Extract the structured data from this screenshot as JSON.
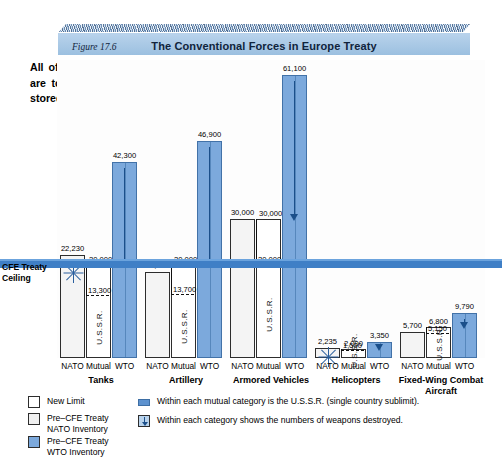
{
  "banner": {
    "figure_label": "Figure 17.6",
    "title": "The Conventional Forces in Europe Treaty"
  },
  "caption": "All of the weapons above the CFE Treaty Ceiling are to be destroyed, permanently redeployed, or stored outside of Europe.",
  "ceiling_label": "CFE Treaty Ceiling",
  "colors": {
    "wto_blue": "#7ca9dc",
    "ceiling_blue": "#3f7fc6",
    "banner_blue": "#b9d3ec",
    "arrow_blue": "#1b4f8a"
  },
  "series_labels": {
    "nato": "NATO",
    "mutual": "Mutual",
    "wto": "WTO",
    "ussr": "U.S.S.R."
  },
  "legend": {
    "swatches": [
      {
        "icon": "empty-square",
        "label": "New Limit"
      },
      {
        "icon": "stipple-square",
        "label": "Pre–CFE Treaty\nNATO Inventory"
      },
      {
        "icon": "blue-square",
        "label": "Pre–CFE Treaty\nWTO Inventory"
      }
    ],
    "notes": [
      {
        "icon": "sublimit-bar-icon",
        "label": "Within each mutual category is the U.S.S.R. (single country sublimit)."
      },
      {
        "icon": "down-arrow-box-icon",
        "label": "Within each category shows the numbers of weapons destroyed."
      }
    ]
  },
  "chart_data": {
    "type": "bar",
    "title": "The Conventional Forces in Europe Treaty",
    "xlabel": "",
    "ylabel": "",
    "ylim": [
      0,
      61100
    ],
    "grid": false,
    "legend_position": "bottom-left",
    "ceiling_note": "Horizontal blue band marks the CFE Treaty Ceiling for each category",
    "categories": [
      "Tanks",
      "Artillery",
      "Armored Vehicles",
      "Helicopters",
      "Fixed-Wing Combat Aircraft"
    ],
    "series": [
      {
        "name": "NATO",
        "values": [
          22230,
          18500,
          30000,
          2235,
          5700
        ]
      },
      {
        "name": "Mutual",
        "values": [
          20000,
          20000,
          30000,
          2000,
          6800
        ]
      },
      {
        "name": "WTO",
        "values": [
          42300,
          46900,
          61100,
          3350,
          9790
        ]
      }
    ],
    "ussr_sublimit": [
      13300,
      13700,
      20000,
      1500,
      5150
    ],
    "ceiling": [
      20000,
      20000,
      30000,
      2000,
      6800
    ],
    "value_labels": {
      "nato": [
        "22,230",
        "18,500",
        "30,000",
        "2,235",
        "5,700"
      ],
      "mutual": [
        "20,000",
        "20,000",
        "30,000",
        "2,000",
        "6,800"
      ],
      "wto": [
        "42,300",
        "46,900",
        "61,100",
        "3,350",
        "9,790"
      ],
      "ussr": [
        "13,300",
        "13,700",
        "20,000",
        "1,500",
        "5,150"
      ]
    }
  }
}
